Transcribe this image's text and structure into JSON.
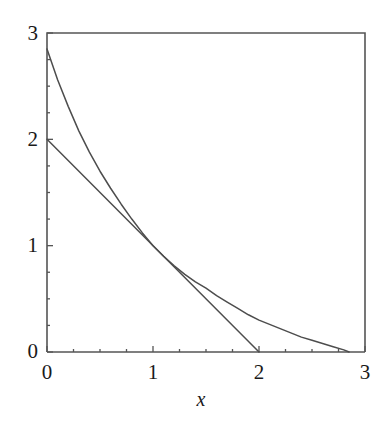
{
  "figure": {
    "background_color": "#ffffff",
    "line_color": "#4d4d4d",
    "axis_color": "#555555",
    "text_color": "#1a1a1a"
  },
  "chart_data": {
    "type": "line",
    "title": "",
    "xlabel": "x",
    "ylabel": "",
    "xlim": [
      0,
      3
    ],
    "ylim": [
      0,
      3
    ],
    "grid": false,
    "legend": null,
    "xticks": [
      0,
      1,
      2,
      3
    ],
    "xtick_labels": [
      "0",
      "1",
      "2",
      "3"
    ],
    "yticks": [
      0,
      1,
      2,
      3
    ],
    "ytick_labels": [
      "0",
      "1",
      "2",
      "3"
    ],
    "x_minor_ticks": [
      0.25,
      0.5,
      0.75,
      1.25,
      1.5,
      1.75,
      2.25,
      2.5,
      2.75
    ],
    "y_minor_ticks": [
      0.25,
      0.5,
      0.75,
      1.25,
      1.5,
      1.75,
      2.25,
      2.5,
      2.75
    ],
    "series": [
      {
        "name": "curve",
        "kind": "curve",
        "description": "decreasing convex curve from (0, 2.85) to (2.85, 0)",
        "x": [
          0.0,
          0.1,
          0.2,
          0.3,
          0.4,
          0.5,
          0.6,
          0.7,
          0.8,
          0.9,
          1.0,
          1.1,
          1.2,
          1.3,
          1.4,
          1.5,
          1.6,
          1.7,
          1.8,
          1.9,
          2.0,
          2.1,
          2.2,
          2.3,
          2.4,
          2.5,
          2.6,
          2.7,
          2.8,
          2.85
        ],
        "y": [
          2.85,
          2.56,
          2.31,
          2.08,
          1.88,
          1.7,
          1.54,
          1.39,
          1.25,
          1.12,
          1.0,
          0.9,
          0.81,
          0.73,
          0.66,
          0.6,
          0.53,
          0.47,
          0.41,
          0.35,
          0.3,
          0.26,
          0.22,
          0.18,
          0.14,
          0.11,
          0.08,
          0.05,
          0.02,
          0.0
        ]
      },
      {
        "name": "tangent-line",
        "kind": "line",
        "description": "straight line from (0, 2) to (2, 0), tangent to curve near (1, 1)",
        "x": [
          0.0,
          2.0
        ],
        "y": [
          2.0,
          0.0
        ]
      }
    ],
    "annotations": []
  },
  "axes": {
    "x_axis_name": "x-axis",
    "y_axis_name": "y-axis",
    "axis_title_x": "x"
  }
}
